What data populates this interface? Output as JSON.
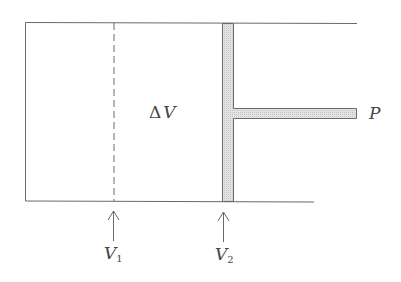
{
  "diagram": {
    "labels": {
      "delta_v": "ΔV",
      "delta_v_symbol": "Δ",
      "delta_v_var": "V",
      "pressure": "P",
      "v1_main": "V",
      "v1_sub": "1",
      "v2_main": "V",
      "v2_sub": "2"
    },
    "colors": {
      "line": "#6a6a6a",
      "piston_fill": "#d9d9d9",
      "text": "#444444"
    },
    "elements": [
      {
        "id": "cylinder",
        "type": "open-rectangle",
        "description": "cylinder walls open on the right"
      },
      {
        "id": "initial-position",
        "type": "dashed-line",
        "label": "V1"
      },
      {
        "id": "piston",
        "type": "shaded-bar",
        "label": "V2"
      },
      {
        "id": "piston-rod",
        "type": "shaded-bar",
        "label": "P"
      },
      {
        "id": "arrow-v1",
        "type": "arrow",
        "points_to": "initial-position"
      },
      {
        "id": "arrow-v2",
        "type": "arrow",
        "points_to": "piston"
      }
    ]
  }
}
